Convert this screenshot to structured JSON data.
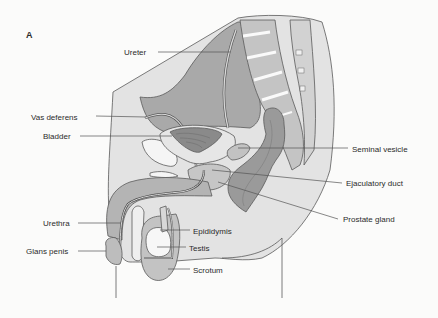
{
  "figure": {
    "panel_label": "A",
    "labels": [
      {
        "id": "ureter",
        "text": "Ureter"
      },
      {
        "id": "vas-deferens",
        "text": "Vas deferens"
      },
      {
        "id": "bladder",
        "text": "Bladder"
      },
      {
        "id": "seminal-vesicle",
        "text": "Seminal vesicle"
      },
      {
        "id": "ejaculatory-duct",
        "text": "Ejaculatory duct"
      },
      {
        "id": "prostate-gland",
        "text": "Prostate gland"
      },
      {
        "id": "urethra",
        "text": "Urethra"
      },
      {
        "id": "epididymis",
        "text": "Epididymis"
      },
      {
        "id": "glans-penis",
        "text": "Glans penis"
      },
      {
        "id": "testis",
        "text": "Testis"
      },
      {
        "id": "scrotum",
        "text": "Scrotum"
      }
    ]
  },
  "colors": {
    "background": "#fbfbfa",
    "tissue_light": "#dcdcdc",
    "tissue_mid": "#b9b9b9",
    "tissue_dark": "#8e8e8e",
    "bone": "#f2f2f2",
    "outline": "#5a5a5a",
    "text": "#2b2b2b"
  }
}
